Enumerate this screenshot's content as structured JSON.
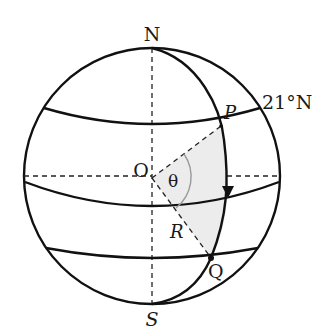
{
  "diagram": {
    "type": "sphere-latitude-geometry",
    "labels": {
      "north_pole": "N",
      "south_pole": "S",
      "center": "O",
      "point_p": "P",
      "point_q": "Q",
      "point_r": "R",
      "angle": "θ",
      "latitude": "21°N"
    },
    "elements": {
      "sphere_outline": "circle",
      "axis": "dashed vertical N–S",
      "equator_radius": "dashed horizontal through O",
      "latitude_circles": [
        "upper (21°N)",
        "middle",
        "lower"
      ],
      "meridian": "great-circle arc N→P→Q→S with downward arrow",
      "shaded_sector": "region bounded by OP, OQ and meridian arc PQ",
      "angle_arc": "θ between OP and OQ"
    },
    "colors": {
      "stroke": "#111111",
      "shading": "#ececec",
      "angle_arc": "#9a9a9a"
    }
  }
}
